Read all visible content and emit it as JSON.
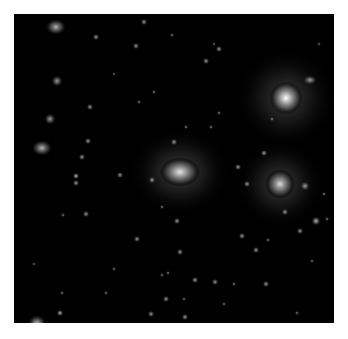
{
  "image": {
    "subject": "galaxy cluster deep-field photograph",
    "background_color": "#000000",
    "frame_color": "#ffffff",
    "caption_cut_off": ""
  },
  "objects": [
    {
      "type": "bright-star",
      "x": 272,
      "y": 84,
      "r": 16,
      "glow": 1.0
    },
    {
      "type": "central-galaxy",
      "x": 166,
      "y": 158,
      "r": 14,
      "glow": 0.9,
      "elong": 1.4
    },
    {
      "type": "cluster-galaxy",
      "x": 266,
      "y": 170,
      "r": 14,
      "glow": 0.85
    },
    {
      "type": "galaxy",
      "x": 42,
      "y": 13,
      "r": 7,
      "glow": 0.7,
      "elong": 1.3
    },
    {
      "type": "galaxy",
      "x": 28,
      "y": 134,
      "r": 7,
      "glow": 0.7,
      "elong": 1.3
    },
    {
      "type": "galaxy",
      "x": 36,
      "y": 105,
      "r": 5,
      "glow": 0.6
    },
    {
      "type": "galaxy",
      "x": 43,
      "y": 67,
      "r": 5,
      "glow": 0.6
    },
    {
      "type": "galaxy",
      "x": 23,
      "y": 310,
      "r": 8,
      "glow": 0.8
    },
    {
      "type": "star",
      "x": 82,
      "y": 23,
      "r": 3,
      "glow": 0.6
    },
    {
      "type": "star",
      "x": 76,
      "y": 93,
      "r": 3,
      "glow": 0.6
    },
    {
      "type": "star",
      "x": 74,
      "y": 127,
      "r": 3,
      "glow": 0.6
    },
    {
      "type": "star",
      "x": 68,
      "y": 143,
      "r": 3,
      "glow": 0.6
    },
    {
      "type": "star",
      "x": 62,
      "y": 162,
      "r": 3,
      "glow": 0.7
    },
    {
      "type": "star",
      "x": 62,
      "y": 169,
      "r": 3,
      "glow": 0.6
    },
    {
      "type": "star",
      "x": 106,
      "y": 161,
      "r": 3,
      "glow": 0.6
    },
    {
      "type": "star",
      "x": 72,
      "y": 200,
      "r": 3,
      "glow": 0.6
    },
    {
      "type": "star",
      "x": 49,
      "y": 201,
      "r": 2,
      "glow": 0.5
    },
    {
      "type": "star",
      "x": 130,
      "y": 8,
      "r": 3,
      "glow": 0.6
    },
    {
      "type": "star",
      "x": 158,
      "y": 21,
      "r": 2,
      "glow": 0.5
    },
    {
      "type": "star",
      "x": 192,
      "y": 47,
      "r": 3,
      "glow": 0.6
    },
    {
      "type": "star",
      "x": 205,
      "y": 35,
      "r": 3,
      "glow": 0.6
    },
    {
      "type": "star",
      "x": 122,
      "y": 32,
      "r": 3,
      "glow": 0.6
    },
    {
      "type": "star",
      "x": 172,
      "y": 113,
      "r": 2,
      "glow": 0.5
    },
    {
      "type": "star",
      "x": 160,
      "y": 128,
      "r": 3,
      "glow": 0.6
    },
    {
      "type": "star",
      "x": 140,
      "y": 78,
      "r": 2,
      "glow": 0.5
    },
    {
      "type": "star",
      "x": 125,
      "y": 88,
      "r": 2,
      "glow": 0.5
    },
    {
      "type": "star",
      "x": 138,
      "y": 166,
      "r": 3,
      "glow": 0.6
    },
    {
      "type": "star",
      "x": 148,
      "y": 193,
      "r": 2,
      "glow": 0.5
    },
    {
      "type": "star",
      "x": 205,
      "y": 99,
      "r": 2,
      "glow": 0.5
    },
    {
      "type": "star",
      "x": 197,
      "y": 113,
      "r": 2,
      "glow": 0.5
    },
    {
      "type": "star",
      "x": 296,
      "y": 66,
      "r": 4,
      "glow": 0.6,
      "elong": 1.5
    },
    {
      "type": "star",
      "x": 250,
      "y": 139,
      "r": 3,
      "glow": 0.6
    },
    {
      "type": "star",
      "x": 224,
      "y": 153,
      "r": 3,
      "glow": 0.6
    },
    {
      "type": "star",
      "x": 233,
      "y": 170,
      "r": 3,
      "glow": 0.6
    },
    {
      "type": "star",
      "x": 291,
      "y": 172,
      "r": 4,
      "glow": 0.6
    },
    {
      "type": "star",
      "x": 271,
      "y": 198,
      "r": 3,
      "glow": 0.6
    },
    {
      "type": "star",
      "x": 286,
      "y": 217,
      "r": 3,
      "glow": 0.6
    },
    {
      "type": "star",
      "x": 310,
      "y": 180,
      "r": 2,
      "glow": 0.5
    },
    {
      "type": "star",
      "x": 313,
      "y": 205,
      "r": 2,
      "glow": 0.5
    },
    {
      "type": "star",
      "x": 228,
      "y": 222,
      "r": 3,
      "glow": 0.6
    },
    {
      "type": "star",
      "x": 163,
      "y": 207,
      "r": 3,
      "glow": 0.6
    },
    {
      "type": "star",
      "x": 123,
      "y": 225,
      "r": 3,
      "glow": 0.6
    },
    {
      "type": "star",
      "x": 166,
      "y": 238,
      "r": 3,
      "glow": 0.6
    },
    {
      "type": "star",
      "x": 242,
      "y": 236,
      "r": 3,
      "glow": 0.6
    },
    {
      "type": "star",
      "x": 254,
      "y": 226,
      "r": 2,
      "glow": 0.5
    },
    {
      "type": "star",
      "x": 302,
      "y": 207,
      "r": 4,
      "glow": 0.7
    },
    {
      "type": "star",
      "x": 148,
      "y": 261,
      "r": 2,
      "glow": 0.5
    },
    {
      "type": "star",
      "x": 154,
      "y": 259,
      "r": 2,
      "glow": 0.5
    },
    {
      "type": "star",
      "x": 181,
      "y": 266,
      "r": 3,
      "glow": 0.6
    },
    {
      "type": "star",
      "x": 201,
      "y": 268,
      "r": 3,
      "glow": 0.6
    },
    {
      "type": "star",
      "x": 252,
      "y": 270,
      "r": 3,
      "glow": 0.6
    },
    {
      "type": "star",
      "x": 298,
      "y": 247,
      "r": 2,
      "glow": 0.5
    },
    {
      "type": "star",
      "x": 170,
      "y": 285,
      "r": 2,
      "glow": 0.5
    },
    {
      "type": "star",
      "x": 137,
      "y": 300,
      "r": 3,
      "glow": 0.6
    },
    {
      "type": "star",
      "x": 171,
      "y": 303,
      "r": 3,
      "glow": 0.6
    },
    {
      "type": "star",
      "x": 152,
      "y": 285,
      "r": 3,
      "glow": 0.6
    },
    {
      "type": "star",
      "x": 46,
      "y": 299,
      "r": 3,
      "glow": 0.7
    },
    {
      "type": "star",
      "x": 48,
      "y": 279,
      "r": 2,
      "glow": 0.5
    },
    {
      "type": "star",
      "x": 92,
      "y": 279,
      "r": 2,
      "glow": 0.5
    },
    {
      "type": "star",
      "x": 210,
      "y": 290,
      "r": 2,
      "glow": 0.5
    },
    {
      "type": "star",
      "x": 283,
      "y": 299,
      "r": 2,
      "glow": 0.5
    },
    {
      "type": "star",
      "x": 220,
      "y": 270,
      "r": 2,
      "glow": 0.5
    },
    {
      "type": "star",
      "x": 100,
      "y": 255,
      "r": 2,
      "glow": 0.5
    },
    {
      "type": "star",
      "x": 20,
      "y": 250,
      "r": 2,
      "glow": 0.4
    },
    {
      "type": "star",
      "x": 305,
      "y": 30,
      "r": 2,
      "glow": 0.4
    },
    {
      "type": "star",
      "x": 200,
      "y": 30,
      "r": 2,
      "glow": 0.4
    },
    {
      "type": "star",
      "x": 100,
      "y": 60,
      "r": 2,
      "glow": 0.4
    },
    {
      "type": "star",
      "x": 258,
      "y": 105,
      "r": 2,
      "glow": 0.5
    }
  ]
}
